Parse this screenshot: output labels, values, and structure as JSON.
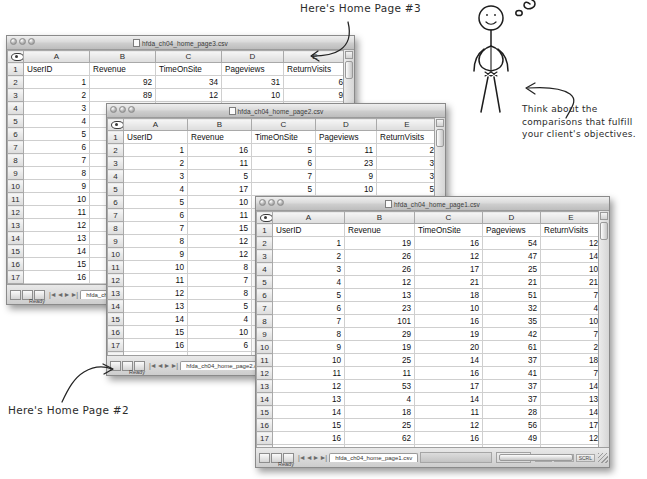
{
  "columns": [
    "A",
    "B",
    "C",
    "D",
    "E"
  ],
  "headers": [
    "UserID",
    "Revenue",
    "TimeOnSite",
    "Pageviews",
    "ReturnVisits"
  ],
  "status": {
    "ready": "Ready",
    "modes": [
      "NUM",
      "CAPS",
      "SCRL"
    ]
  },
  "windows": [
    {
      "id": "home-page-3",
      "title": "hfda_ch04_home_page3.csv",
      "tab_label": "hfda_ch04_home_page3.csv",
      "rows": [
        {
          "n": "2",
          "cells": [
            "1",
            "92",
            "34",
            "31",
            "6"
          ]
        },
        {
          "n": "3",
          "cells": [
            "2",
            "89",
            "12",
            "10",
            "9"
          ]
        },
        {
          "n": "4",
          "cells": [
            "3",
            "77",
            "6",
            "41",
            "2"
          ]
        },
        {
          "n": "5",
          "cells": [
            "4",
            "",
            "",
            "",
            ""
          ]
        },
        {
          "n": "6",
          "cells": [
            "5",
            "",
            "",
            "",
            ""
          ]
        },
        {
          "n": "7",
          "cells": [
            "6",
            "",
            "",
            "",
            ""
          ]
        },
        {
          "n": "8",
          "cells": [
            "7",
            "",
            "",
            "",
            ""
          ]
        },
        {
          "n": "9",
          "cells": [
            "8",
            "",
            "",
            "",
            ""
          ]
        },
        {
          "n": "10",
          "cells": [
            "9",
            "",
            "",
            "",
            ""
          ]
        },
        {
          "n": "11",
          "cells": [
            "10",
            "",
            "",
            "",
            ""
          ]
        },
        {
          "n": "12",
          "cells": [
            "11",
            "",
            "",
            "",
            ""
          ]
        },
        {
          "n": "13",
          "cells": [
            "12",
            "",
            "",
            "",
            ""
          ]
        },
        {
          "n": "14",
          "cells": [
            "13",
            "",
            "",
            "",
            ""
          ]
        },
        {
          "n": "15",
          "cells": [
            "14",
            "",
            "",
            "",
            ""
          ]
        },
        {
          "n": "16",
          "cells": [
            "15",
            "",
            "",
            "",
            ""
          ]
        },
        {
          "n": "17",
          "cells": [
            "16",
            "",
            "",
            "",
            ""
          ]
        },
        {
          "n": "18",
          "cells": [
            "17",
            "",
            "",
            "",
            ""
          ]
        },
        {
          "n": "19",
          "cells": [
            "18",
            "",
            "",
            "",
            ""
          ]
        },
        {
          "n": "20",
          "cells": [
            "19",
            "",
            "",
            "",
            ""
          ]
        },
        {
          "n": "21",
          "cells": [
            "20",
            "",
            "",
            "",
            ""
          ]
        }
      ]
    },
    {
      "id": "home-page-2",
      "title": "hfda_ch04_home_page2.csv",
      "tab_label": "hfda_ch04_home_page2.csv",
      "rows": [
        {
          "n": "2",
          "cells": [
            "1",
            "16",
            "5",
            "11",
            "2"
          ]
        },
        {
          "n": "3",
          "cells": [
            "2",
            "11",
            "6",
            "23",
            "3"
          ]
        },
        {
          "n": "4",
          "cells": [
            "3",
            "5",
            "7",
            "9",
            "3"
          ]
        },
        {
          "n": "5",
          "cells": [
            "4",
            "17",
            "5",
            "10",
            "5"
          ]
        },
        {
          "n": "6",
          "cells": [
            "5",
            "10",
            "5",
            "24",
            "2"
          ]
        },
        {
          "n": "7",
          "cells": [
            "6",
            "11",
            "5",
            "16",
            "5"
          ]
        },
        {
          "n": "8",
          "cells": [
            "7",
            "15",
            "",
            "",
            ""
          ]
        },
        {
          "n": "9",
          "cells": [
            "8",
            "12",
            "",
            "",
            ""
          ]
        },
        {
          "n": "10",
          "cells": [
            "9",
            "12",
            "",
            "",
            ""
          ]
        },
        {
          "n": "11",
          "cells": [
            "10",
            "8",
            "",
            "",
            ""
          ]
        },
        {
          "n": "12",
          "cells": [
            "11",
            "7",
            "",
            "",
            ""
          ]
        },
        {
          "n": "13",
          "cells": [
            "12",
            "8",
            "",
            "",
            ""
          ]
        },
        {
          "n": "14",
          "cells": [
            "13",
            "5",
            "",
            "",
            ""
          ]
        },
        {
          "n": "15",
          "cells": [
            "14",
            "4",
            "",
            "",
            ""
          ]
        },
        {
          "n": "16",
          "cells": [
            "15",
            "10",
            "",
            "",
            ""
          ]
        },
        {
          "n": "17",
          "cells": [
            "16",
            "6",
            "",
            "",
            ""
          ]
        },
        {
          "n": "18",
          "cells": [
            "17",
            "10",
            "",
            "",
            ""
          ]
        },
        {
          "n": "19",
          "cells": [
            "18",
            "4",
            "",
            "",
            ""
          ]
        },
        {
          "n": "20",
          "cells": [
            "19",
            "11",
            "",
            "",
            ""
          ]
        },
        {
          "n": "21",
          "cells": [
            "20",
            "10",
            "",
            "",
            ""
          ]
        },
        {
          "n": "22",
          "cells": [
            "",
            "",
            "",
            "",
            ""
          ]
        }
      ]
    },
    {
      "id": "home-page-1",
      "title": "hfda_ch04_home_page1.csv",
      "tab_label": "hfda_ch04_home_page1.csv",
      "rows": [
        {
          "n": "2",
          "cells": [
            "1",
            "19",
            "16",
            "54",
            "12"
          ]
        },
        {
          "n": "3",
          "cells": [
            "2",
            "26",
            "12",
            "47",
            "14"
          ]
        },
        {
          "n": "4",
          "cells": [
            "3",
            "26",
            "17",
            "25",
            "10"
          ]
        },
        {
          "n": "5",
          "cells": [
            "4",
            "12",
            "21",
            "21",
            "21"
          ]
        },
        {
          "n": "6",
          "cells": [
            "5",
            "13",
            "18",
            "51",
            "7"
          ]
        },
        {
          "n": "7",
          "cells": [
            "6",
            "23",
            "10",
            "32",
            "4"
          ]
        },
        {
          "n": "8",
          "cells": [
            "7",
            "101",
            "16",
            "35",
            "10"
          ]
        },
        {
          "n": "9",
          "cells": [
            "8",
            "29",
            "19",
            "42",
            "7"
          ]
        },
        {
          "n": "10",
          "cells": [
            "9",
            "19",
            "20",
            "61",
            "2"
          ]
        },
        {
          "n": "11",
          "cells": [
            "10",
            "25",
            "14",
            "37",
            "18"
          ]
        },
        {
          "n": "12",
          "cells": [
            "11",
            "11",
            "16",
            "41",
            "7"
          ]
        },
        {
          "n": "13",
          "cells": [
            "12",
            "53",
            "17",
            "37",
            "14"
          ]
        },
        {
          "n": "14",
          "cells": [
            "13",
            "4",
            "14",
            "37",
            "13"
          ]
        },
        {
          "n": "15",
          "cells": [
            "14",
            "18",
            "11",
            "28",
            "14"
          ]
        },
        {
          "n": "16",
          "cells": [
            "15",
            "25",
            "12",
            "56",
            "17"
          ]
        },
        {
          "n": "17",
          "cells": [
            "16",
            "62",
            "16",
            "49",
            "12"
          ]
        },
        {
          "n": "18",
          "cells": [
            "17",
            "60",
            "12",
            "63",
            "11"
          ]
        },
        {
          "n": "19",
          "cells": [
            "18",
            "57",
            "12",
            "24",
            "3"
          ]
        },
        {
          "n": "20",
          "cells": [
            "19",
            "28",
            "13",
            "39",
            "13"
          ]
        },
        {
          "n": "21",
          "cells": [
            "20",
            "31",
            "13",
            "45",
            "4"
          ]
        }
      ]
    }
  ],
  "annotations": {
    "page3": "Here's Home Page #3",
    "page2": "Here's Home Page #2",
    "think_line1": "Think about the",
    "think_line2": "comparisons that fulfill",
    "think_line3": "your client's objectives."
  }
}
